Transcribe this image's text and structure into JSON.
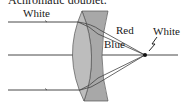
{
  "title": "Achromatic doublet.",
  "labels": {
    "incoming_light": "White",
    "red_ray": "Red",
    "blue_ray": "Blue",
    "focus_light": "White"
  },
  "colors": {
    "lens_fill": "#b4b4b4",
    "lens_edge": "#555555",
    "ray": "#333333",
    "background": "#ffffff"
  },
  "elements": {
    "converging_lens": "crown glass convex lens",
    "diverging_lens": "flint glass concave lens",
    "optical_axis": "horizontal axis",
    "focal_point": "focal point"
  }
}
